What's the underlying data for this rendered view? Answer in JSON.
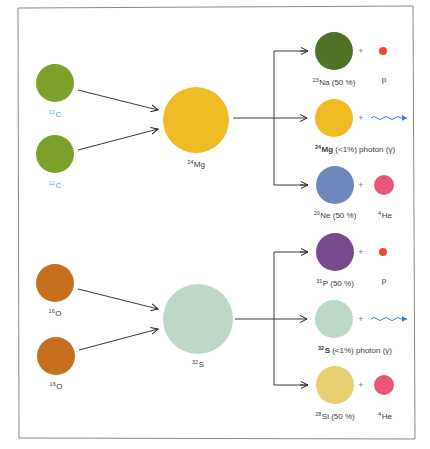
{
  "diagram": {
    "colors": {
      "carbon": "#7ea12c",
      "oxygen": "#c6701e",
      "magnesium24": "#f0bc26",
      "sulfur32": "#bcd8c6",
      "sodium23": "#4f7226",
      "neon20": "#6f88bc",
      "phosphorus31": "#7a4a8e",
      "silicon28": "#e8cf72",
      "proton": "#ec4a2a",
      "helium4": "#e8567a",
      "photon": "#3a7cc8",
      "arrow": "#222222",
      "border": "#666666"
    },
    "reactions": [
      {
        "name": "carbon-fusion",
        "reactants": [
          {
            "mass": "12",
            "symbol": "C"
          },
          {
            "mass": "12",
            "symbol": "C"
          }
        ],
        "compound": {
          "mass": "24",
          "symbol": "Mg"
        },
        "products": [
          {
            "mass": "23",
            "symbol": "Na",
            "rest": " (50 %)",
            "by": "p",
            "by_type": "proton"
          },
          {
            "mass": "24",
            "symbol": "Mg",
            "rest": " (<1%) photon (γ)",
            "by": "",
            "by_type": "photon"
          },
          {
            "mass": "20",
            "symbol": "Ne",
            "rest": " (50 %)",
            "by": "He",
            "by_mass": "4",
            "by_type": "helium"
          }
        ]
      },
      {
        "name": "oxygen-fusion",
        "reactants": [
          {
            "mass": "16",
            "symbol": "O"
          },
          {
            "mass": "16",
            "symbol": "O"
          }
        ],
        "compound": {
          "mass": "32",
          "symbol": "S"
        },
        "products": [
          {
            "mass": "31",
            "symbol": "P",
            "rest": " (50 %)",
            "by": "p",
            "by_type": "proton"
          },
          {
            "mass": "32",
            "symbol": "S",
            "rest": " (<1%) photon (γ)",
            "by": "",
            "by_type": "photon"
          },
          {
            "mass": "28",
            "symbol": "Si",
            "rest": " (50 %)",
            "by": "He",
            "by_mass": "4",
            "by_type": "helium"
          }
        ]
      }
    ],
    "plus_sign": "+"
  }
}
